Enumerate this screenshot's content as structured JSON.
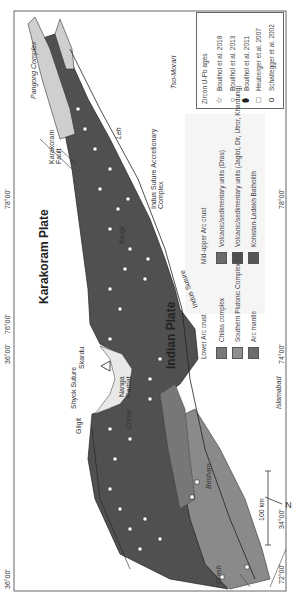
{
  "map": {
    "plates": {
      "karakoram": "Karakoram Plate",
      "indian": "Indian Plate"
    },
    "features": {
      "shyok_suture": "Shyok Suture",
      "indus_suture_east": "Indus Suture",
      "indus_suture_accretionary": "Indus Suture Accretionary Complex",
      "karakoram_fault": "Karakoram Fault",
      "pangong_complex": "Pangong Complex",
      "tso_morari": "Tso-Morari",
      "nidar_ophiolite": "Nidar ophiolite",
      "nanga_parbat": "Nanga Parbat"
    },
    "places": {
      "leh": "Leh",
      "kargil": "Kargil",
      "gilgit": "Gilgit",
      "chilas": "Chilas",
      "besham": "Besham",
      "drosh": "Drosh",
      "islamabad": "Islamabad",
      "skardu": "Skardu"
    },
    "coordinates": {
      "lon_72": "72°00'",
      "lon_74": "74°00'",
      "lon_76": "76°00'",
      "lon_78_top": "78°00'",
      "lon_78_bottom": "78°00'",
      "lat_34": "34°00'",
      "lat_36_top": "36°00'",
      "lat_36_bottom": "36°00'"
    },
    "scale_bar": "100 km",
    "north_arrow": "N"
  },
  "legend_ages": {
    "title": "Zircon U-Pb ages",
    "items": [
      {
        "symbol": "☆",
        "icon": "star-icon",
        "label": "Bouilhol et al. 2018"
      },
      {
        "symbol": "○",
        "icon": "circle-icon",
        "label": "Bouilhol et al. 2013"
      },
      {
        "symbol": "⬮",
        "icon": "filled-ellipse-icon",
        "label": "Bouilhol et al. 2011"
      },
      {
        "symbol": "□",
        "icon": "square-icon",
        "label": "Heuberger et al. 2007"
      },
      {
        "symbol": "0",
        "icon": "ellipse-icon",
        "label": "Schaltegger et al. 2002"
      }
    ]
  },
  "legend_units": {
    "lower": {
      "title": "Lower Arc crust",
      "items": [
        {
          "label": "Chilas complex",
          "color": "#7a7a7a"
        },
        {
          "label": "Southern Plutonic Complex",
          "color": "#8e8e8e"
        },
        {
          "label": "Arc mantle",
          "color": "#6c6c6c"
        }
      ]
    },
    "upper": {
      "title": "Mid-upper Arc crust",
      "items": [
        {
          "label": "Volcanic/sedimentary units (Dras)",
          "color": "#6a6a6a"
        },
        {
          "label": "Volcanic/sedimentary units (Jaglot, Dir, Utror, Khardung)",
          "color": "#4e4e4e"
        },
        {
          "label": "Kohistan-Ladakh Batholith",
          "color": "#575757"
        }
      ]
    }
  },
  "colors": {
    "batholith": "#505050",
    "southern_plutonic": "#8a8a8a",
    "chilas": "#777777",
    "accretionary": "#e8e8e8",
    "background": "#ffffff",
    "tso_morari": "#cfcfcf"
  }
}
